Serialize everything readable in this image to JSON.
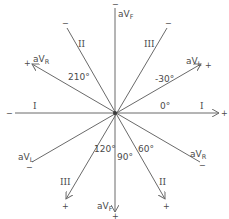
{
  "diagram": {
    "center": {
      "x": 115,
      "y": 113
    },
    "colors": {
      "line": "#6a6a6a",
      "text": "#4a4a4a",
      "background": "#ffffff"
    },
    "leads": [
      {
        "name": "I",
        "angle_label": "0°",
        "positive": "+",
        "negative": "−"
      },
      {
        "name": "II",
        "angle_label": "60°",
        "positive": "+",
        "negative": "−"
      },
      {
        "name": "III",
        "angle_label": "120°",
        "positive": "+",
        "negative": "−"
      },
      {
        "name": "aVR",
        "angle_label": "210°",
        "positive": "+",
        "negative": "−"
      },
      {
        "name": "aVL",
        "angle_label": "-30°",
        "positive": "+",
        "negative": "−"
      },
      {
        "name": "aVF",
        "angle_label": "90°",
        "positive": "+",
        "negative": "−"
      }
    ],
    "labels": {
      "lead_I_left": "I",
      "lead_I_right": "I",
      "lead_II_upper": "II",
      "lead_II_lower": "II",
      "lead_III_upper": "III",
      "lead_III_lower": "III",
      "aVR_main": "aV",
      "aVR_sub": "R",
      "aVL_main": "aV",
      "aVL_sub": "L",
      "aVF_main": "aV",
      "aVF_sub": "F",
      "angle_0": "0°",
      "angle_neg30": "-30°",
      "angle_60": "60°",
      "angle_90": "90°",
      "angle_120": "120°",
      "angle_210": "210°",
      "plus": "+",
      "minus": "−"
    }
  }
}
